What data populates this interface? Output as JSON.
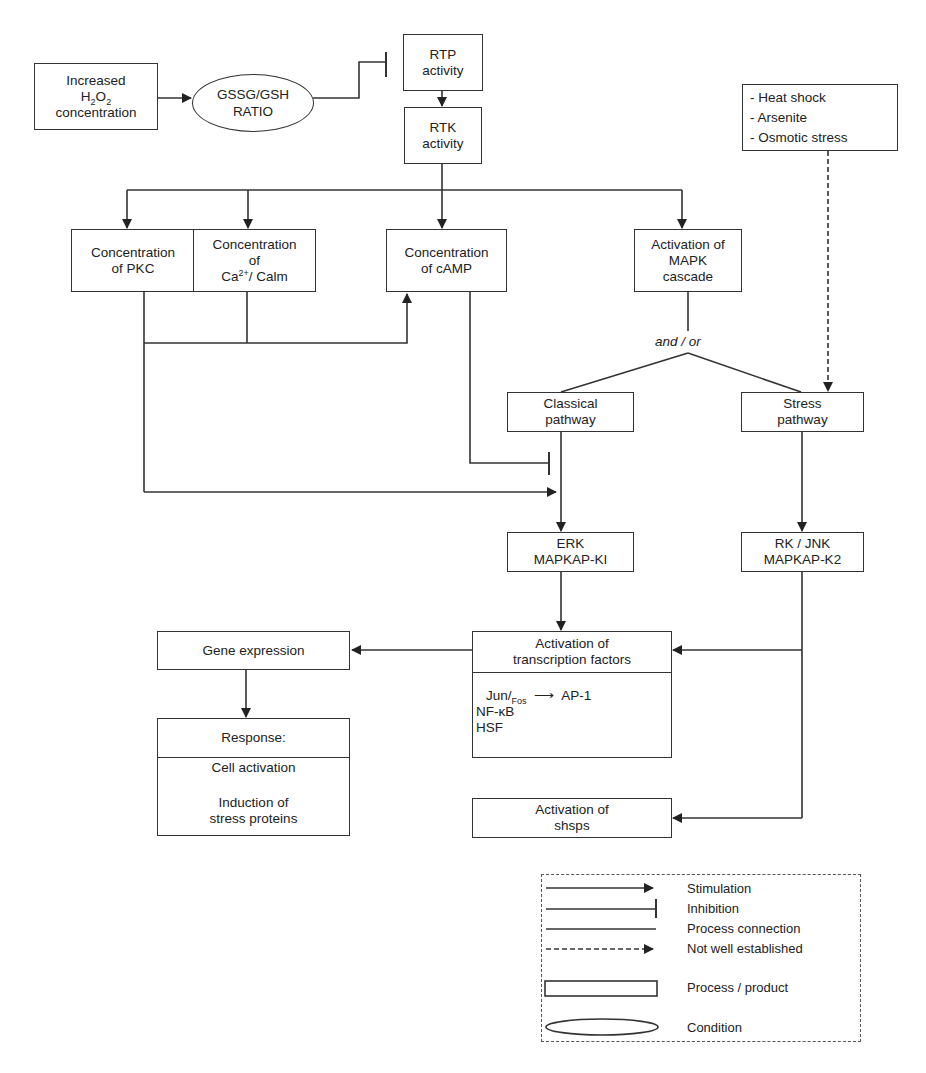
{
  "nodes": {
    "h2o2": {
      "line1": "Increased",
      "line2_base": "H",
      "line2_sub1": "2",
      "line2_mid": "O",
      "line2_sub2": "2",
      "line3": "concentration"
    },
    "gssg": {
      "line1": "GSSG/GSH",
      "line2": "RATIO"
    },
    "rtp": {
      "line1": "RTP",
      "line2": "activity"
    },
    "rtk": {
      "line1": "RTK",
      "line2": "activity"
    },
    "stress_inducers": {
      "items": [
        "- Heat shock",
        "- Arsenite",
        "- Osmotic stress"
      ]
    },
    "pkc": {
      "line1": "Concentration",
      "line2": "of PKC"
    },
    "ca": {
      "line1": "Concentration",
      "line2": "of",
      "line3_base": "Ca",
      "line3_sup": "2+",
      "line3_rest": "/ Calm"
    },
    "camp": {
      "line1": "Concentration",
      "line2": "of cAMP"
    },
    "mapk": {
      "line1": "Activation of",
      "line2": "MAPK",
      "line3": "cascade"
    },
    "and_or": "and / or",
    "classical": {
      "line1": "Classical",
      "line2": "pathway"
    },
    "stress_pathway": {
      "line1": "Stress",
      "line2": "pathway"
    },
    "erk": {
      "line1": "ERK",
      "line2": "MAPKAP-KI"
    },
    "rkjnk": {
      "line1": "RK / JNK",
      "line2": "MAPKAP-K2"
    },
    "gene_expression": {
      "label": "Gene expression"
    },
    "transcription": {
      "head1": "Activation of",
      "head2": "transcription factors",
      "jun": "Jun/",
      "fos": "Fos",
      "arrow": "⟶",
      "ap1": "AP-1",
      "nfkb": "NF-κB",
      "hsf": "HSF"
    },
    "response": {
      "head": "Response:",
      "item1": "Cell activation",
      "item2a": "Induction of",
      "item2b": "stress proteins"
    },
    "shsps": {
      "line1": "Activation of",
      "line2": "shsps"
    }
  },
  "legend": {
    "items": [
      {
        "symbol": "solid-arrow",
        "label": "Stimulation"
      },
      {
        "symbol": "inhibition-bar",
        "label": "Inhibition"
      },
      {
        "symbol": "plain-line",
        "label": "Process connection"
      },
      {
        "symbol": "dashed-arrow",
        "label": "Not well established"
      },
      {
        "symbol": "rectangle",
        "label": "Process / product"
      },
      {
        "symbol": "ellipse",
        "label": "Condition"
      }
    ]
  },
  "colors": {
    "line": "#333333",
    "background": "#ffffff",
    "text": "#222222"
  }
}
